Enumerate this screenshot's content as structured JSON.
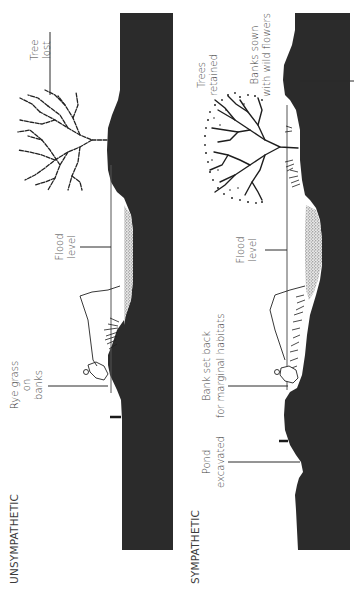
{
  "diagram": {
    "orientation": "rotated-90-ccw",
    "panels": [
      {
        "id": "unsympathetic",
        "title": "UNSYMPATHETIC",
        "labels": {
          "tree": [
            "Tree",
            "lost"
          ],
          "flood": [
            "Flood",
            "level"
          ],
          "grass": [
            "Rye grass",
            "on",
            "banks"
          ]
        }
      },
      {
        "id": "sympathetic",
        "title": "SYMPATHETIC",
        "labels": {
          "tree": [
            "Trees",
            "retained"
          ],
          "banks": [
            "Banks sown",
            "with wild flowers"
          ],
          "flood": [
            "Flood",
            "level"
          ],
          "setback": [
            "Bank set back",
            "for marginal habitats"
          ],
          "pond": [
            "Pond",
            "excavated"
          ]
        }
      }
    ],
    "colors": {
      "ground": "#2b2b2b",
      "water_stipple": "#9a9a9a",
      "text": "#3a3a3a",
      "background": "#ffffff"
    }
  }
}
